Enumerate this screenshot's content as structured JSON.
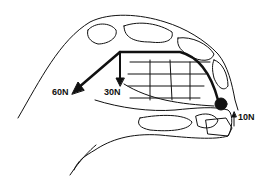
{
  "diagram": {
    "colors": {
      "line": "#111111",
      "background": "#ffffff"
    },
    "forces": [
      {
        "label": "60N",
        "direction": "down-left"
      },
      {
        "label": "30N",
        "direction": "down"
      },
      {
        "label": "10N",
        "direction": "up"
      }
    ]
  }
}
